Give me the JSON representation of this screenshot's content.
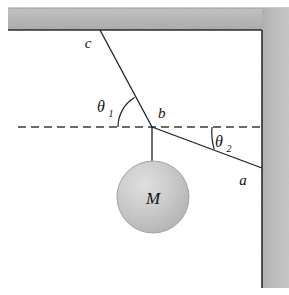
{
  "figure": {
    "background_color": "#ffffff",
    "stroke_color": "#1a1a1a",
    "wall_fill_color": "#b0b0b0",
    "wall_edge_color": "#333333",
    "ball_fill_color": "#c8c8c8",
    "ball_edge_color": "#9a9a9a"
  },
  "labels": {
    "point_c": "c",
    "point_b": "b",
    "point_a": "a",
    "mass": "M",
    "theta1": "θ",
    "theta1_sub": "1",
    "theta2": "θ",
    "theta2_sub": "2"
  },
  "geometry": {
    "ceiling": {
      "x": 8,
      "y": 8,
      "width": 281,
      "height": 22
    },
    "wall": {
      "x": 262,
      "y": 8,
      "width": 27,
      "height": 280
    },
    "anchor_c": {
      "x": 100,
      "y": 30
    },
    "junction_b": {
      "x": 152,
      "y": 127
    },
    "anchor_a": {
      "x": 262,
      "y": 168
    },
    "ball": {
      "cx": 153,
      "cy": 197,
      "r": 36
    },
    "dashed_line": {
      "x1": 18,
      "x2": 262,
      "y": 127
    },
    "theta1_arc_radius": 34,
    "theta2_arc_radius": 60
  },
  "label_positions": {
    "point_c": {
      "x": 88,
      "y": 48
    },
    "point_b": {
      "x": 158,
      "y": 118
    },
    "point_a": {
      "x": 243,
      "y": 185
    },
    "mass": {
      "x": 153,
      "y": 205
    },
    "theta1": {
      "x": 101,
      "y": 112
    },
    "theta2": {
      "x": 216,
      "y": 147
    }
  }
}
